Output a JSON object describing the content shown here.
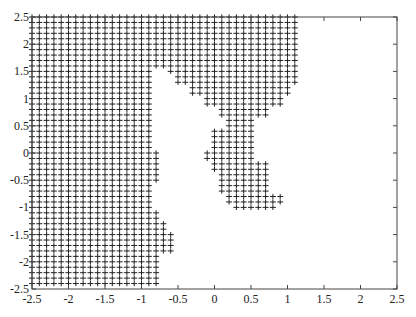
{
  "chart_data": {
    "type": "scatter",
    "title": "",
    "xlabel": "",
    "ylabel": "",
    "xlim": [
      -2.5,
      2.5
    ],
    "ylim": [
      -2.5,
      2.5
    ],
    "grid": false,
    "marker": "+",
    "marker_color": "#222222",
    "grid_step": 0.1,
    "x_ticks": [
      "-2.5",
      "-2",
      "-1.5",
      "-1",
      "-0.5",
      "0",
      "0.5",
      "1",
      "1.5",
      "2",
      "2.5"
    ],
    "y_ticks": [
      "2.5",
      "2",
      "1.5",
      "1",
      "0.5",
      "0",
      "-0.5",
      "-1",
      "-1.5",
      "-2",
      "-2.5"
    ],
    "rows": [
      {
        "y_from": 2.5,
        "y_to": 1.6,
        "spans": [
          [
            -2.5,
            1.1
          ]
        ]
      },
      {
        "y_from": 1.5,
        "y_to": 1.5,
        "spans": [
          [
            -2.5,
            -0.9
          ],
          [
            -0.6,
            1.1
          ]
        ]
      },
      {
        "y_from": 1.4,
        "y_to": 1.3,
        "spans": [
          [
            -2.5,
            -0.9
          ],
          [
            -0.5,
            1.1
          ]
        ]
      },
      {
        "y_from": 1.2,
        "y_to": 1.1,
        "spans": [
          [
            -2.5,
            -0.9
          ],
          [
            -0.3,
            1.0
          ]
        ]
      },
      {
        "y_from": 1.0,
        "y_to": 0.9,
        "spans": [
          [
            -2.5,
            -0.9
          ],
          [
            -0.1,
            0.9
          ]
        ]
      },
      {
        "y_from": 0.8,
        "y_to": 0.7,
        "spans": [
          [
            -2.5,
            -0.9
          ],
          [
            0.1,
            0.7
          ]
        ]
      },
      {
        "y_from": 0.6,
        "y_to": 0.5,
        "spans": [
          [
            -2.5,
            -0.9
          ],
          [
            0.2,
            0.5
          ]
        ]
      },
      {
        "y_from": 0.4,
        "y_to": 0.3,
        "spans": [
          [
            -2.5,
            -0.9
          ],
          [
            0.0,
            0.5
          ]
        ]
      },
      {
        "y_from": 0.2,
        "y_to": 0.1,
        "spans": [
          [
            -2.5,
            -0.9
          ],
          [
            0.0,
            0.5
          ]
        ]
      },
      {
        "y_from": 0.0,
        "y_to": -0.1,
        "spans": [
          [
            -2.5,
            -0.8
          ],
          [
            -0.1,
            0.5
          ]
        ]
      },
      {
        "y_from": -0.2,
        "y_to": -0.3,
        "spans": [
          [
            -2.5,
            -0.8
          ],
          [
            0.0,
            0.7
          ]
        ]
      },
      {
        "y_from": -0.4,
        "y_to": -0.5,
        "spans": [
          [
            -2.5,
            -0.8
          ],
          [
            0.1,
            0.7
          ]
        ]
      },
      {
        "y_from": -0.6,
        "y_to": -0.7,
        "spans": [
          [
            -2.5,
            -0.9
          ],
          [
            0.1,
            0.7
          ]
        ]
      },
      {
        "y_from": -0.8,
        "y_to": -0.9,
        "spans": [
          [
            -2.5,
            -0.9
          ],
          [
            0.2,
            0.9
          ]
        ]
      },
      {
        "y_from": -1.0,
        "y_to": -1.0,
        "spans": [
          [
            -2.5,
            -0.9
          ],
          [
            0.3,
            0.8
          ]
        ]
      },
      {
        "y_from": -1.1,
        "y_to": -1.2,
        "spans": [
          [
            -2.5,
            -0.8
          ]
        ]
      },
      {
        "y_from": -1.3,
        "y_to": -1.4,
        "spans": [
          [
            -2.5,
            -0.7
          ]
        ]
      },
      {
        "y_from": -1.5,
        "y_to": -1.8,
        "spans": [
          [
            -2.5,
            -0.6
          ]
        ]
      },
      {
        "y_from": -1.9,
        "y_to": -2.4,
        "spans": [
          [
            -2.5,
            -0.8
          ]
        ]
      }
    ]
  }
}
